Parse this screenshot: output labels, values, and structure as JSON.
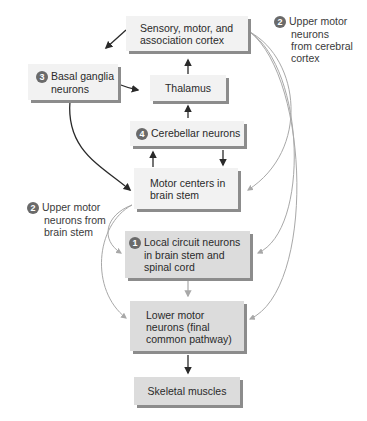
{
  "diagram": {
    "nodes": {
      "cortex": {
        "line1": "Sensory, motor, and",
        "line2": "association cortex"
      },
      "basal_ganglia": {
        "badge": "3",
        "line1": "Basal ganglia",
        "line2": "neurons"
      },
      "thalamus": {
        "line1": "Thalamus"
      },
      "cerebellar": {
        "badge": "4",
        "line1": "Cerebellar neurons"
      },
      "motor_centers": {
        "line1": "Motor centers in",
        "line2": "brain stem"
      },
      "local_circuit": {
        "badge": "1",
        "line1": "Local circuit neurons",
        "line2": "in brain stem and",
        "line3": "spinal cord"
      },
      "lower_motor": {
        "line1": "Lower motor",
        "line2": "neurons (final",
        "line3": "common pathway)"
      },
      "skeletal": {
        "line1": "Skeletal muscles"
      }
    },
    "labels": {
      "umn_cortex": {
        "badge": "2",
        "line1": "Upper motor",
        "line2": "neurons",
        "line3": "from cerebral",
        "line4": "cortex"
      },
      "umn_brainstem": {
        "badge": "2",
        "line1": "Upper motor",
        "line2": "neurons from",
        "line3": "brain stem"
      }
    },
    "colors": {
      "box_fill": "#ececec",
      "box_shadow": "#8c8c8c",
      "badge": "#6a6a6a",
      "dark_arrow": "#2a2a2a",
      "gray_arrow": "#a8a8a8"
    }
  }
}
